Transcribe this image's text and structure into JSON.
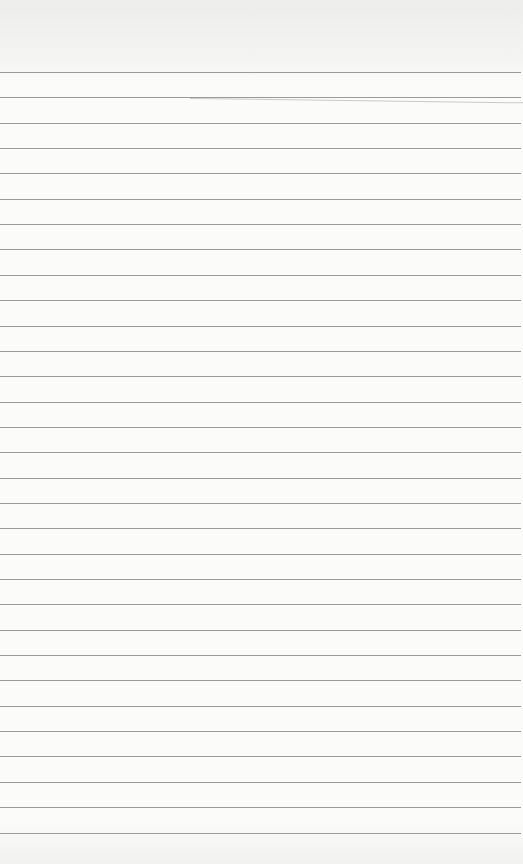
{
  "paper": {
    "type": "ruled-notebook-page",
    "background": "#fbfbfa",
    "line_color": "#9a9a98",
    "first_line_y": 72,
    "line_spacing": 25.35,
    "line_count": 31
  }
}
